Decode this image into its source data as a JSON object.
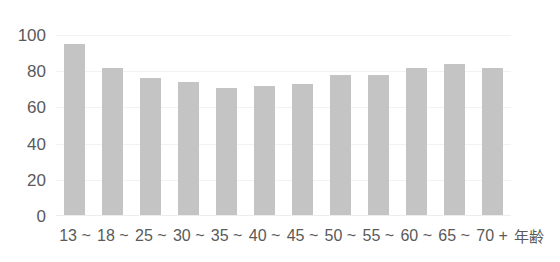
{
  "chart_data": {
    "type": "bar",
    "title": "",
    "xlabel": "年齢",
    "ylabel": "",
    "categories": [
      "13 ~",
      "18 ~",
      "25 ~",
      "30 ~",
      "35 ~",
      "40 ~",
      "45 ~",
      "50 ~",
      "55 ~",
      "60 ~",
      "65 ~",
      "70 +"
    ],
    "values": [
      95,
      82,
      76,
      74,
      71,
      72,
      73,
      78,
      78,
      82,
      84,
      82
    ],
    "ylim": [
      0,
      100
    ],
    "yticks": [
      "0",
      "20",
      "40",
      "60",
      "80",
      "100"
    ],
    "ytick_values": [
      0,
      20,
      40,
      60,
      80,
      100
    ],
    "grid": true,
    "legend": null,
    "bar_color": "#c4c4c4",
    "grid_color": "#f2f2f2",
    "text_color": "#5a5a5a",
    "background": "#ffffff"
  },
  "overlay": {
    "cropped_title_sliver": ""
  }
}
